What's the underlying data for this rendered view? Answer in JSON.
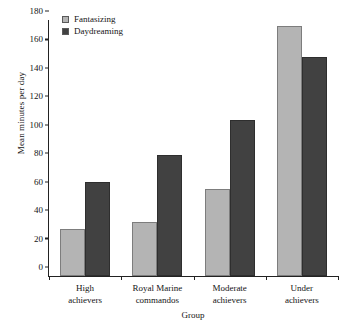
{
  "chart_data": {
    "type": "bar",
    "title": "",
    "xlabel": "Group",
    "ylabel": "Mean minutes per day",
    "categories": [
      "High achievers",
      "Royal Marine commandos",
      "Moderate achievers",
      "Under achievers"
    ],
    "category_lines": [
      [
        "High",
        "achievers"
      ],
      [
        "Royal Marine",
        "commandos"
      ],
      [
        "Moderate",
        "achievers"
      ],
      [
        "Under",
        "achievers"
      ]
    ],
    "series": [
      {
        "name": "Fantasizing",
        "color": "#b4b4b4",
        "values": [
          33,
          38,
          61,
          176
        ]
      },
      {
        "name": "Daydreaming",
        "color": "#414141",
        "values": [
          66,
          85,
          110,
          154
        ]
      }
    ],
    "ylim": [
      0,
      180
    ],
    "yticks": [
      0,
      20,
      40,
      60,
      80,
      100,
      120,
      140,
      160,
      180
    ],
    "ytick_labels": [
      "0",
      "20",
      "40",
      "60",
      "80",
      "100",
      "120",
      "140",
      "160",
      "180"
    ],
    "grid": false,
    "legend_position": "top-left"
  },
  "legend": {
    "entries": [
      {
        "label": "Fantasizing",
        "color": "#b4b4b4"
      },
      {
        "label": "Daydreaming",
        "color": "#414141"
      }
    ]
  },
  "axes": {
    "x_title": "Group",
    "y_title": "Mean minutes per day"
  }
}
